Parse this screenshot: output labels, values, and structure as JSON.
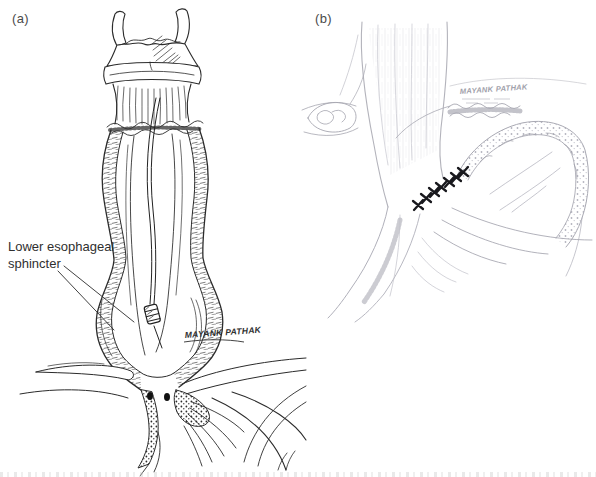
{
  "figure": {
    "background": "#ffffff",
    "panel_a": {
      "label": "(a)",
      "annotation": {
        "line1": "Lower esophageal",
        "line2": "sphincter"
      },
      "signature": "MAYANK PATHAK",
      "ink_color": "#2b2b2b"
    },
    "panel_b": {
      "label": "(b)",
      "signature": "MAYANK PATHAK",
      "pencil_color": "#b3b3bb",
      "suture_color": "#18181d",
      "suture_count": 7
    }
  }
}
